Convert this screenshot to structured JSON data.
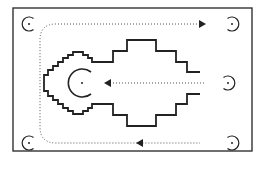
{
  "diagram": {
    "frame": {
      "x": 13,
      "y": 8,
      "width": 239,
      "height": 143
    },
    "colors": {
      "stroke": "#222222",
      "dotted": "#555555",
      "frame": "#333333",
      "background": "#ffffff"
    },
    "markers": [
      {
        "id": "top-left",
        "cx": 29,
        "cy": 24,
        "r": 7,
        "opening": "right"
      },
      {
        "id": "top-right",
        "cx": 232,
        "cy": 24,
        "r": 7,
        "opening": "left"
      },
      {
        "id": "middle-right",
        "cx": 228,
        "cy": 83,
        "r": 7,
        "opening": "left"
      },
      {
        "id": "bottom-left",
        "cx": 29,
        "cy": 143,
        "r": 7,
        "opening": "right"
      },
      {
        "id": "bottom-right",
        "cx": 232,
        "cy": 143,
        "r": 7,
        "opening": "left"
      },
      {
        "id": "center",
        "cx": 82,
        "cy": 83,
        "r": 14,
        "opening": "right"
      }
    ],
    "paths": [
      {
        "id": "top-path",
        "direction": "right"
      },
      {
        "id": "middle-path",
        "direction": "left"
      },
      {
        "id": "bottom-path",
        "direction": "left"
      }
    ]
  }
}
